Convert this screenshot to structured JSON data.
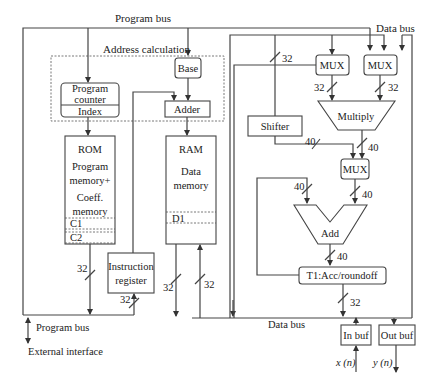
{
  "diagram": {
    "labels": {
      "program_bus_top": "Program bus",
      "data_bus_top": "Data bus",
      "address_calculation": "Address calculation",
      "program_bus_bottom": "Program bus",
      "external_interface": "External interface",
      "data_bus_bottom": "Data bus",
      "x_n": "x (n)",
      "y_n": "y (n)"
    },
    "blocks": {
      "program_counter": "Program",
      "program_counter_2": "counter",
      "index": "Index",
      "base": "Base",
      "adder": "Adder",
      "rom": "ROM",
      "rom_l1": "Program",
      "rom_l2": "memory+",
      "rom_l3": "Coeff.",
      "rom_l4": "memory",
      "c1": "C1",
      "c2": "C2",
      "ram": "RAM",
      "ram_l1": "Data",
      "ram_l2": "memory",
      "d1": "D1",
      "instr_l1": "Instruction",
      "instr_l2": "register",
      "mux1": "MUX",
      "mux2": "MUX",
      "mux3": "MUX",
      "shifter": "Shifter",
      "multiply": "Multiply",
      "add": "Add",
      "acc": "T1:Acc/roundoff",
      "in_buf": "In buf",
      "out_buf": "Out buf"
    },
    "bus_widths": {
      "shifter_in": "32",
      "mux1_out": "32",
      "mux2_out": "32",
      "shifter_out": "40",
      "mult_out": "40",
      "feedback": "40",
      "mux3_out": "40",
      "add_out": "40",
      "acc_out": "32",
      "rom_out": "32",
      "instr_in": "32",
      "ram_out": "32",
      "ram_in": "32"
    }
  }
}
